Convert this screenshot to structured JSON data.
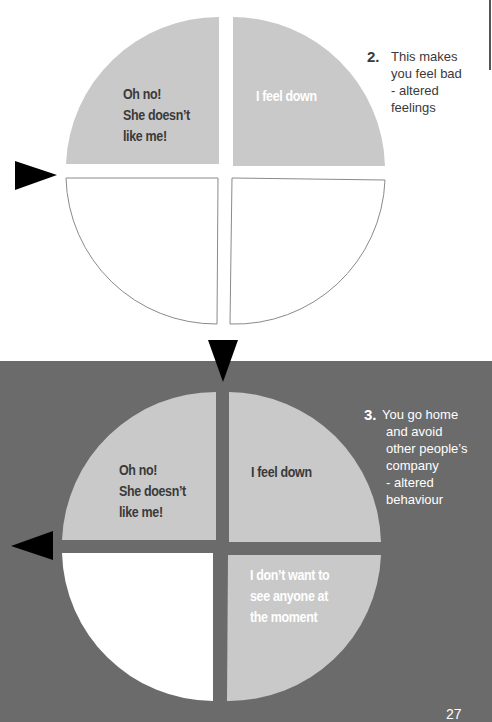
{
  "colors": {
    "band": "#6b6b6b",
    "filled_quadrant": "#c9c9c9",
    "empty_quadrant": "#ffffff",
    "outline": "#8a8a8a",
    "arrow": "#000000",
    "dark_text": "#3a3a3a",
    "light_text": "#ffffff"
  },
  "top_diagram": {
    "quadrants": {
      "top_left": {
        "lines": [
          "Oh no!",
          "She doesn’t",
          "like me!"
        ],
        "filled": true
      },
      "top_right": {
        "lines": [
          "I feel down"
        ],
        "filled": true
      },
      "bottom_left": {
        "lines": [],
        "filled": false
      },
      "bottom_right": {
        "lines": [],
        "filled": false
      }
    },
    "note": {
      "number": "2.",
      "lines": [
        "This makes",
        "you feel bad",
        "- altered",
        "feelings"
      ]
    }
  },
  "bottom_diagram": {
    "quadrants": {
      "top_left": {
        "lines": [
          "Oh no!",
          "She doesn’t",
          "like me!"
        ],
        "filled": true
      },
      "top_right": {
        "lines": [
          "I feel down"
        ],
        "filled": true
      },
      "bottom_left": {
        "lines": [],
        "filled": false
      },
      "bottom_right": {
        "lines": [
          "I don’t want to",
          "see anyone at",
          "the  moment"
        ],
        "filled": true
      }
    },
    "note": {
      "number": "3.",
      "lines": [
        "You go home",
        "and avoid",
        "other people’s",
        "company",
        "- altered",
        "behaviour"
      ]
    }
  },
  "arrows": [
    {
      "name": "arrow-right-top",
      "direction": "right"
    },
    {
      "name": "arrow-down-middle",
      "direction": "down"
    },
    {
      "name": "arrow-left-bottom",
      "direction": "left"
    }
  ],
  "page_number": "27"
}
